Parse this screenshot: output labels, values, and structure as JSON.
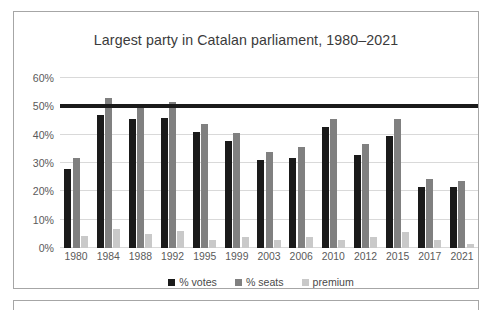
{
  "chart_data": {
    "type": "bar",
    "title": "Largest party in Catalan parliament, 1980–2021",
    "xlabel": "",
    "ylabel": "",
    "ylim": [
      0,
      60
    ],
    "ytick_step": 10,
    "ytick_labels": [
      "0%",
      "10%",
      "20%",
      "30%",
      "40%",
      "50%",
      "60%"
    ],
    "grid": true,
    "legend_position": "bottom",
    "categories": [
      "1980",
      "1984",
      "1988",
      "1992",
      "1995",
      "1999",
      "2003",
      "2006",
      "2010",
      "2012",
      "2015",
      "2017",
      "2021"
    ],
    "series": [
      {
        "name": "% votes",
        "color": "#1a1a1a",
        "values": [
          27.8,
          46.8,
          45.7,
          46.0,
          40.9,
          37.7,
          30.9,
          31.8,
          42.6,
          32.8,
          39.6,
          21.5,
          21.5
        ]
      },
      {
        "name": "% seats",
        "color": "#808080",
        "values": [
          31.9,
          52.8,
          50.4,
          51.5,
          43.7,
          40.7,
          33.8,
          35.6,
          45.6,
          36.7,
          45.6,
          24.5,
          23.5
        ]
      },
      {
        "name": "premium",
        "color": "#c9c9c9",
        "values": [
          4.1,
          6.8,
          4.9,
          5.9,
          2.9,
          3.9,
          2.8,
          3.8,
          2.8,
          3.8,
          5.6,
          2.8,
          1.5
        ]
      }
    ],
    "annotations": [
      {
        "name": "majority-reference-line",
        "type": "hline",
        "value": 50,
        "color": "#1a1a1a"
      }
    ]
  },
  "legend": {
    "items": [
      {
        "label": "% votes",
        "color": "#1a1a1a"
      },
      {
        "label": "% seats",
        "color": "#808080"
      },
      {
        "label": "premium",
        "color": "#c9c9c9"
      }
    ]
  },
  "colors": {
    "frame_border": "#a6a6a6",
    "gridline": "#d9d9d9",
    "title_text": "#3b3b3b",
    "axis_text": "#5a5a5a",
    "background": "#ffffff"
  }
}
